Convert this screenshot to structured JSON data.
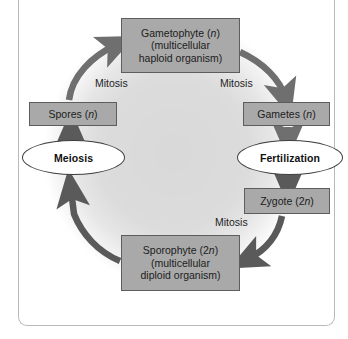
{
  "diagram": {
    "colors": {
      "box_fill": "#a9a9a9",
      "box_border": "#5d5d5d",
      "oval_fill": "#ffffff",
      "oval_border": "#3d3d3d",
      "arrow": "#6f6f6f",
      "arrow_dark": "#5a5a5a",
      "background": "#ffffff",
      "halo": "#d9d9d9",
      "frame_border": "#b9b9bb",
      "text": "#1c1c1c"
    },
    "nodes": {
      "gametophyte": {
        "line1": "Gametophyte (",
        "ploidy": "n",
        "line1_end": ")",
        "line2": "(multicellular",
        "line3": "haploid organism)"
      },
      "spores": {
        "text": "Spores (",
        "ploidy": "n",
        "text_end": ")"
      },
      "gametes": {
        "text": "Gametes (",
        "ploidy": "n",
        "text_end": ")"
      },
      "zygote": {
        "text": "Zygote (2",
        "ploidy": "n",
        "text_end": ")"
      },
      "sporophyte": {
        "line1": "Sporophyte (2",
        "ploidy": "n",
        "line1_end": ")",
        "line2": "(multicellular",
        "line3": "diploid organism)"
      }
    },
    "ovals": {
      "meiosis": "Meiosis",
      "fertilization": "Fertilization"
    },
    "labels": {
      "mitosis_top_left": "Mitosis",
      "mitosis_top_right": "Mitosis",
      "mitosis_bottom_right": "Mitosis"
    }
  }
}
